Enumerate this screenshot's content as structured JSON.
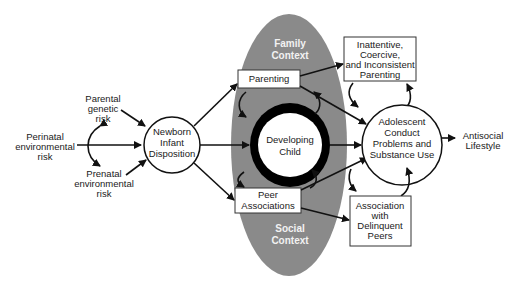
{
  "diagram": {
    "colors": {
      "context_ellipse": "#8a8a8a",
      "context_text": "#f2f2f2",
      "lines": "#111111",
      "background": "#ffffff"
    },
    "risk_factors": {
      "parental_genetic": [
        "Parental",
        "genetic",
        "risk"
      ],
      "perinatal_environmental": [
        "Perinatal",
        "environmental",
        "risk"
      ],
      "prenatal_environmental": [
        "Prenatal",
        "environmental",
        "risk"
      ]
    },
    "newborn": [
      "Newborn",
      "Infant",
      "Disposition"
    ],
    "family_context": [
      "Family",
      "Context"
    ],
    "social_context": [
      "Social",
      "Context"
    ],
    "parenting": "Parenting",
    "developing_child": [
      "Developing",
      "Child"
    ],
    "peer_associations": [
      "Peer",
      "Associations"
    ],
    "inattentive_parenting": [
      "Inattentive,",
      "Coercive,",
      "and Inconsistent",
      "Parenting"
    ],
    "adolescent": [
      "Adolescent",
      "Conduct",
      "Problems and",
      "Substance Use"
    ],
    "delinquent_peers": [
      "Association",
      "with",
      "Delinquent",
      "Peers"
    ],
    "outcome": [
      "Antisocial",
      "Lifestyle"
    ]
  }
}
